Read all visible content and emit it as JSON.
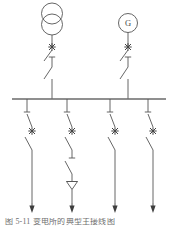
{
  "figure": {
    "caption": "图 5-11  变电所的典型主接线图",
    "line_color": "#555555",
    "bus_color": "#6a6a6a",
    "background": "#ffffff"
  },
  "sources": [
    {
      "id": "transformer-incomer",
      "symbol": "two-winding-transformer",
      "label": "",
      "x": 52,
      "devices": [
        "circuit-breaker",
        "disconnector",
        "disconnector"
      ]
    },
    {
      "id": "generator-incomer",
      "symbol": "generator",
      "label": "G",
      "x": 128,
      "devices": [
        "circuit-breaker",
        "disconnector",
        "disconnector"
      ]
    }
  ],
  "busbar": {
    "name": "main-busbar",
    "x1": 12,
    "x2": 166,
    "y": 99,
    "voltage_label": ""
  },
  "feeders": [
    {
      "id": "feeder-1",
      "x": 27,
      "devices": [
        "disconnector",
        "circuit-breaker",
        "disconnector"
      ],
      "terminal": "arrow",
      "has_arrester": false
    },
    {
      "id": "feeder-2",
      "x": 67,
      "devices": [
        "disconnector",
        "circuit-breaker",
        "disconnector",
        "disconnector"
      ],
      "terminal": "arrow",
      "has_arrester": true
    },
    {
      "id": "feeder-3",
      "x": 110,
      "devices": [
        "disconnector",
        "circuit-breaker",
        "disconnector"
      ],
      "terminal": "arrow",
      "has_arrester": false
    },
    {
      "id": "feeder-4",
      "x": 148,
      "devices": [
        "disconnector",
        "circuit-breaker",
        "disconnector"
      ],
      "terminal": "arrow",
      "has_arrester": false
    }
  ],
  "legend": {
    "circuit_breaker_glyph": "star",
    "disconnector_glyph": "open-blade",
    "arrester_glyph": "down-triangle",
    "load_glyph": "down-arrow"
  }
}
